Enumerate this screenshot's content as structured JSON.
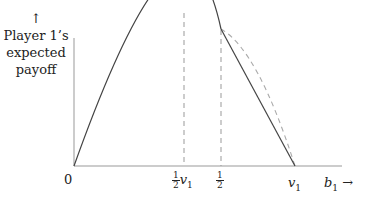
{
  "diagram": {
    "type": "line",
    "y_axis": {
      "arrow": "↑",
      "label_lines": [
        "Player 1’s",
        "expected",
        "payoff"
      ]
    },
    "x_axis": {
      "origin_label": "0",
      "label_var": "b",
      "label_sub": "1",
      "arrow": "→",
      "ticks": [
        {
          "id": "half_v1",
          "num": "1",
          "den": "2",
          "var": "v",
          "sub": "1"
        },
        {
          "id": "half",
          "num": "1",
          "den": "2"
        },
        {
          "id": "v1",
          "var": "v",
          "sub": "1"
        }
      ]
    },
    "curves": [
      {
        "name": "expected-payoff-solid",
        "style": "solid",
        "description": "concave parabola from 0 peaking at v1/2, then linear down to v1 beyond 1/2"
      },
      {
        "name": "parabola-continuation",
        "style": "dashed",
        "description": "parabola continuation from 1/2 to v1"
      }
    ],
    "colors": {
      "solid": "#444444",
      "dashed": "#999999",
      "axis": "#888888"
    }
  }
}
